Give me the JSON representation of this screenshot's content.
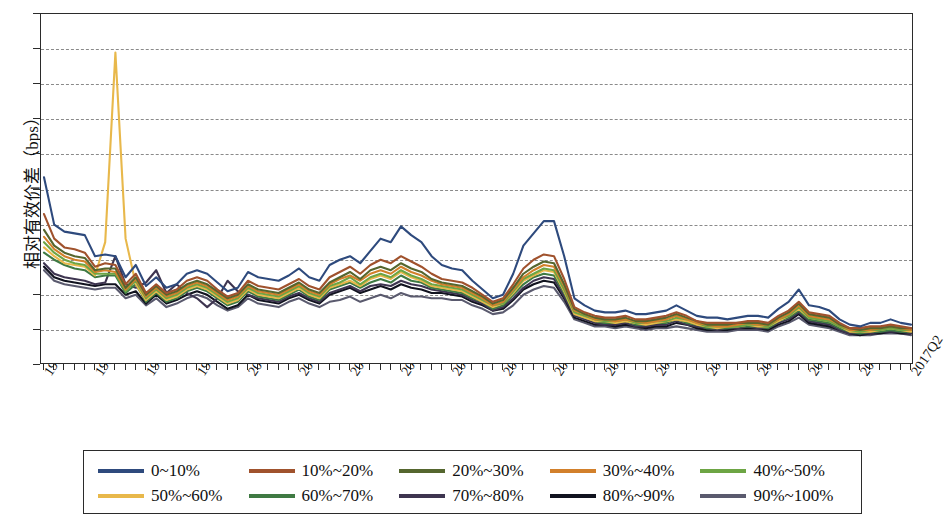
{
  "axes": {
    "y_title": "相对有效价差（bps）",
    "y_ticks": [
      200,
      180,
      160,
      140,
      120,
      100,
      80,
      60,
      40,
      20,
      0
    ],
    "x_tick_labels": [
      "1996Q1",
      "1997Q2",
      "1998Q3",
      "1999Q4",
      "2001Q1",
      "2002Q2",
      "2003Q3",
      "2004Q4",
      "2006Q1",
      "2007Q2",
      "2008Q3",
      "2009Q4",
      "2011Q1",
      "2012Q2",
      "2013Q3",
      "2014Q4",
      "2016Q1",
      "2017Q2"
    ]
  },
  "legend": {
    "rows": [
      [
        {
          "label": "0~10%",
          "color": "#2E4A7D"
        },
        {
          "label": "10%~20%",
          "color": "#A0522D"
        },
        {
          "label": "20%~30%",
          "color": "#55662E"
        },
        {
          "label": "30%~40%",
          "color": "#D2802B"
        },
        {
          "label": "40%~50%",
          "color": "#6DA544"
        }
      ],
      [
        {
          "label": "50%~60%",
          "color": "#E8B84B"
        },
        {
          "label": "60%~70%",
          "color": "#3F7A43"
        },
        {
          "label": "70%~80%",
          "color": "#3E3550"
        },
        {
          "label": "80%~90%",
          "color": "#11131F"
        },
        {
          "label": "90%~100%",
          "color": "#5A5A6E"
        }
      ]
    ]
  },
  "chart_data": {
    "type": "line",
    "title": "",
    "xlabel": "",
    "ylabel": "相对有效价差（bps）",
    "ylim": [
      0,
      200
    ],
    "ytick_step": 20,
    "grid": true,
    "legend_position": "bottom",
    "x": [
      "1996Q1",
      "1996Q2",
      "1996Q3",
      "1996Q4",
      "1997Q1",
      "1997Q2",
      "1997Q3",
      "1997Q4",
      "1998Q1",
      "1998Q2",
      "1998Q3",
      "1998Q4",
      "1999Q1",
      "1999Q2",
      "1999Q3",
      "1999Q4",
      "2000Q1",
      "2000Q2",
      "2000Q3",
      "2000Q4",
      "2001Q1",
      "2001Q2",
      "2001Q3",
      "2001Q4",
      "2002Q1",
      "2002Q2",
      "2002Q3",
      "2002Q4",
      "2003Q1",
      "2003Q2",
      "2003Q3",
      "2003Q4",
      "2004Q1",
      "2004Q2",
      "2004Q3",
      "2004Q4",
      "2005Q1",
      "2005Q2",
      "2005Q3",
      "2005Q4",
      "2006Q1",
      "2006Q2",
      "2006Q3",
      "2006Q4",
      "2007Q1",
      "2007Q2",
      "2007Q3",
      "2007Q4",
      "2008Q1",
      "2008Q2",
      "2008Q3",
      "2008Q4",
      "2009Q1",
      "2009Q2",
      "2009Q3",
      "2009Q4",
      "2010Q1",
      "2010Q2",
      "2010Q3",
      "2010Q4",
      "2011Q1",
      "2011Q2",
      "2011Q3",
      "2011Q4",
      "2012Q1",
      "2012Q2",
      "2012Q3",
      "2012Q4",
      "2013Q1",
      "2013Q2",
      "2013Q3",
      "2013Q4",
      "2014Q1",
      "2014Q2",
      "2014Q3",
      "2014Q4",
      "2015Q1",
      "2015Q2",
      "2015Q3",
      "2015Q4",
      "2016Q1",
      "2016Q2",
      "2016Q3",
      "2016Q4",
      "2017Q1",
      "2017Q2"
    ],
    "series": [
      {
        "name": "0~10%",
        "color": "#2E4A7D",
        "values": [
          107,
          80,
          76,
          75,
          74,
          62,
          63,
          62,
          50,
          57,
          45,
          50,
          44,
          46,
          52,
          54,
          52,
          47,
          42,
          44,
          53,
          50,
          49,
          48,
          51,
          55,
          50,
          48,
          57,
          60,
          62,
          58,
          65,
          72,
          70,
          79,
          74,
          70,
          62,
          57,
          55,
          54,
          48,
          43,
          38,
          40,
          52,
          68,
          75,
          82,
          82,
          62,
          38,
          34,
          31,
          30,
          30,
          31,
          29,
          29,
          30,
          31,
          34,
          31,
          28,
          27,
          27,
          26,
          27,
          28,
          28,
          27,
          32,
          36,
          43,
          34,
          33,
          31,
          26,
          23,
          22,
          24,
          24,
          26,
          24,
          23
        ]
      },
      {
        "name": "10%~20%",
        "color": "#A0522D",
        "values": [
          86,
          72,
          67,
          66,
          64,
          56,
          58,
          57,
          46,
          52,
          41,
          46,
          41,
          43,
          48,
          50,
          48,
          43,
          39,
          41,
          48,
          45,
          44,
          43,
          46,
          49,
          45,
          43,
          50,
          53,
          56,
          52,
          57,
          60,
          58,
          62,
          59,
          56,
          52,
          49,
          48,
          47,
          44,
          40,
          36,
          38,
          46,
          55,
          60,
          63,
          62,
          49,
          33,
          30,
          28,
          27,
          27,
          28,
          26,
          26,
          27,
          28,
          30,
          28,
          25,
          24,
          24,
          24,
          24,
          25,
          25,
          24,
          28,
          31,
          36,
          30,
          29,
          28,
          24,
          21,
          21,
          22,
          22,
          23,
          22,
          21
        ]
      },
      {
        "name": "20%~30%",
        "color": "#55662E",
        "values": [
          77,
          68,
          64,
          62,
          61,
          54,
          55,
          55,
          44,
          50,
          40,
          45,
          40,
          42,
          46,
          48,
          46,
          42,
          38,
          40,
          46,
          43,
          42,
          41,
          44,
          47,
          43,
          41,
          47,
          50,
          53,
          49,
          54,
          56,
          54,
          58,
          55,
          53,
          49,
          47,
          46,
          45,
          42,
          39,
          35,
          37,
          44,
          52,
          56,
          59,
          58,
          46,
          32,
          29,
          27,
          26,
          26,
          27,
          25,
          25,
          26,
          27,
          29,
          27,
          25,
          23,
          23,
          23,
          24,
          24,
          24,
          23,
          27,
          30,
          35,
          29,
          28,
          27,
          23,
          21,
          20,
          21,
          21,
          22,
          21,
          21
        ]
      },
      {
        "name": "30%~40%",
        "color": "#D2802B",
        "values": [
          73,
          66,
          62,
          60,
          59,
          53,
          54,
          53,
          43,
          49,
          39,
          44,
          39,
          41,
          45,
          47,
          45,
          41,
          37,
          39,
          45,
          42,
          41,
          40,
          43,
          46,
          42,
          40,
          46,
          49,
          51,
          48,
          52,
          54,
          52,
          56,
          53,
          51,
          48,
          46,
          45,
          44,
          41,
          38,
          34,
          36,
          43,
          50,
          54,
          57,
          56,
          45,
          31,
          29,
          26,
          26,
          25,
          26,
          25,
          24,
          25,
          26,
          28,
          26,
          24,
          23,
          22,
          22,
          23,
          24,
          23,
          23,
          26,
          29,
          34,
          28,
          27,
          26,
          23,
          20,
          20,
          20,
          21,
          22,
          21,
          20
        ]
      },
      {
        "name": "40%~50%",
        "color": "#6DA544",
        "values": [
          70,
          64,
          60,
          58,
          57,
          52,
          52,
          52,
          42,
          48,
          38,
          43,
          38,
          40,
          44,
          46,
          44,
          40,
          36,
          38,
          44,
          41,
          40,
          39,
          42,
          45,
          41,
          39,
          45,
          47,
          50,
          46,
          50,
          52,
          50,
          54,
          51,
          49,
          46,
          45,
          44,
          43,
          40,
          37,
          34,
          35,
          42,
          49,
          52,
          55,
          54,
          43,
          30,
          28,
          26,
          25,
          25,
          26,
          24,
          24,
          25,
          25,
          27,
          26,
          24,
          22,
          22,
          22,
          22,
          23,
          23,
          22,
          26,
          28,
          33,
          27,
          26,
          25,
          22,
          20,
          19,
          20,
          20,
          21,
          20,
          20
        ]
      },
      {
        "name": "50%~60%",
        "color": "#E8B84B",
        "values": [
          67,
          62,
          58,
          57,
          56,
          51,
          70,
          178,
          72,
          46,
          37,
          42,
          37,
          39,
          43,
          45,
          43,
          39,
          35,
          37,
          43,
          40,
          39,
          38,
          41,
          44,
          40,
          38,
          44,
          46,
          48,
          45,
          49,
          51,
          49,
          53,
          50,
          48,
          45,
          44,
          43,
          42,
          39,
          36,
          33,
          35,
          41,
          48,
          51,
          54,
          53,
          42,
          29,
          27,
          25,
          25,
          24,
          25,
          24,
          23,
          24,
          25,
          26,
          25,
          23,
          22,
          21,
          22,
          22,
          23,
          22,
          22,
          25,
          28,
          32,
          27,
          26,
          25,
          22,
          19,
          19,
          19,
          20,
          21,
          20,
          19
        ]
      },
      {
        "name": "60%~70%",
        "color": "#3F7A43",
        "values": [
          64,
          60,
          57,
          55,
          54,
          50,
          51,
          51,
          41,
          46,
          36,
          41,
          36,
          38,
          42,
          44,
          42,
          38,
          34,
          36,
          42,
          39,
          38,
          37,
          40,
          43,
          39,
          37,
          43,
          45,
          47,
          44,
          47,
          49,
          47,
          51,
          48,
          47,
          44,
          43,
          42,
          41,
          38,
          36,
          32,
          34,
          40,
          46,
          50,
          52,
          51,
          41,
          29,
          27,
          25,
          24,
          24,
          25,
          23,
          23,
          24,
          24,
          26,
          24,
          23,
          21,
          21,
          21,
          22,
          22,
          22,
          21,
          25,
          27,
          31,
          26,
          25,
          24,
          21,
          19,
          18,
          19,
          19,
          20,
          19,
          19
        ]
      },
      {
        "name": "70%~80%",
        "color": "#3E3550",
        "values": [
          58,
          52,
          50,
          49,
          48,
          46,
          47,
          62,
          46,
          44,
          47,
          54,
          41,
          46,
          41,
          38,
          33,
          38,
          48,
          42,
          40,
          38,
          37,
          36,
          39,
          41,
          38,
          36,
          41,
          43,
          45,
          42,
          45,
          46,
          45,
          48,
          46,
          45,
          43,
          42,
          41,
          40,
          37,
          35,
          31,
          33,
          38,
          44,
          48,
          50,
          49,
          39,
          28,
          26,
          24,
          23,
          23,
          24,
          22,
          22,
          23,
          23,
          25,
          23,
          22,
          21,
          20,
          21,
          21,
          22,
          21,
          21,
          24,
          26,
          30,
          25,
          24,
          23,
          20,
          18,
          18,
          18,
          19,
          19,
          19,
          18
        ]
      },
      {
        "name": "80%~90%",
        "color": "#11131F",
        "values": [
          56,
          50,
          48,
          47,
          46,
          45,
          46,
          46,
          40,
          42,
          35,
          40,
          35,
          37,
          40,
          42,
          40,
          36,
          32,
          34,
          40,
          37,
          36,
          35,
          38,
          40,
          37,
          35,
          40,
          42,
          44,
          41,
          43,
          45,
          43,
          46,
          44,
          43,
          41,
          41,
          40,
          39,
          36,
          34,
          31,
          32,
          37,
          43,
          46,
          48,
          47,
          38,
          27,
          25,
          23,
          23,
          22,
          23,
          22,
          21,
          22,
          22,
          24,
          23,
          21,
          20,
          20,
          20,
          21,
          21,
          21,
          20,
          23,
          25,
          29,
          24,
          23,
          22,
          20,
          18,
          17,
          18,
          18,
          19,
          18,
          18
        ]
      },
      {
        "name": "90%~100%",
        "color": "#5A5A6E",
        "values": [
          54,
          48,
          46,
          45,
          44,
          43,
          44,
          44,
          38,
          40,
          34,
          38,
          33,
          35,
          38,
          40,
          38,
          34,
          31,
          33,
          38,
          35,
          34,
          33,
          36,
          38,
          35,
          33,
          36,
          37,
          39,
          36,
          38,
          40,
          38,
          41,
          39,
          39,
          38,
          38,
          37,
          37,
          34,
          32,
          29,
          30,
          34,
          40,
          43,
          45,
          44,
          36,
          26,
          24,
          22,
          22,
          21,
          22,
          21,
          20,
          21,
          21,
          22,
          21,
          20,
          19,
          19,
          19,
          20,
          20,
          20,
          19,
          22,
          24,
          27,
          23,
          22,
          21,
          19,
          17,
          17,
          17,
          18,
          18,
          18,
          17
        ]
      }
    ]
  }
}
